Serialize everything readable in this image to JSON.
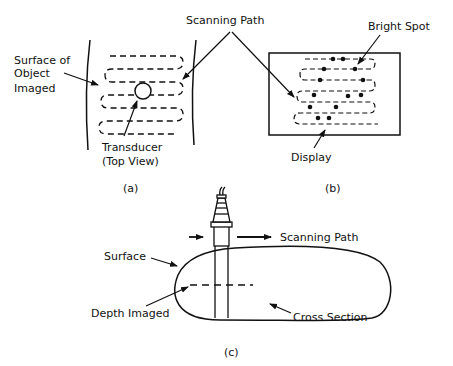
{
  "panel_a": {
    "caption": "(a)",
    "labels": {
      "surface_line1": "Surface of",
      "surface_line2": "Object",
      "surface_line3": "Imaged",
      "transducer_line1": "Transducer",
      "transducer_line2": "(Top View)"
    }
  },
  "shared": {
    "scanning_path": "Scanning Path"
  },
  "panel_b": {
    "caption": "(b)",
    "labels": {
      "bright_spot": "Bright Spot",
      "display": "Display"
    }
  },
  "panel_c": {
    "caption": "(c)",
    "labels": {
      "scanning_path": "Scanning Path",
      "surface": "Surface",
      "depth_imaged": "Depth Imaged",
      "cross_section": "Cross Section"
    }
  },
  "colors": {
    "ink": "#111111",
    "background": "#ffffff"
  }
}
